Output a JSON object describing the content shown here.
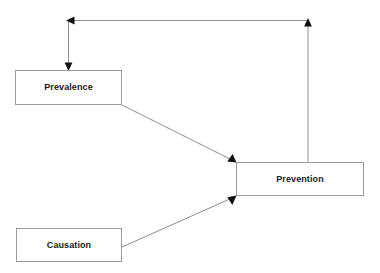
{
  "diagram": {
    "background_color": "#ffffff",
    "node_border_color": "#9b9b9b",
    "node_fill_color": "#ffffff",
    "edge_color": "#8f8f8f",
    "arrowhead_color": "#111111",
    "nodes": [
      {
        "id": "prevalence",
        "label": "Prevalence",
        "x": 15,
        "y": 70,
        "width": 107,
        "height": 35
      },
      {
        "id": "prevention",
        "label": "Prevention",
        "x": 236,
        "y": 162,
        "width": 128,
        "height": 34
      },
      {
        "id": "causation",
        "label": "Causation",
        "x": 16,
        "y": 228,
        "width": 106,
        "height": 34
      }
    ],
    "edges": [
      {
        "id": "prevention-to-prevalence",
        "from": "prevention",
        "to": "prevalence",
        "style": "orthogonal",
        "points": "308,162 308,20 68,20 68,70",
        "arrowheads": [
          {
            "at": "68,70",
            "direction": "down"
          },
          {
            "at": "69,20",
            "direction": "left"
          },
          {
            "at": "308,21",
            "direction": "up"
          }
        ]
      },
      {
        "id": "prevalence-to-prevention",
        "from": "prevalence",
        "to": "prevention",
        "style": "straight",
        "points": "122,105 236,162",
        "arrowheads": [
          {
            "at": "236,162",
            "direction": "down-right"
          }
        ]
      },
      {
        "id": "causation-to-prevention",
        "from": "causation",
        "to": "prevention",
        "style": "straight",
        "points": "122,247 236,196",
        "arrowheads": [
          {
            "at": "236,196",
            "direction": "up-right"
          }
        ]
      }
    ]
  }
}
